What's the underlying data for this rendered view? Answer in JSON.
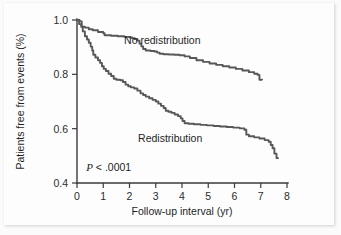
{
  "chart_data": {
    "type": "line",
    "title": "",
    "subtitle": "",
    "xlabel": "Follow-up interval (yr)",
    "ylabel": "Patients free from events (%)",
    "xlim": [
      0,
      8
    ],
    "ylim": [
      0.4,
      1.0
    ],
    "xticks": [
      "0",
      "1",
      "2",
      "3",
      "4",
      "5",
      "6",
      "7",
      "8"
    ],
    "xtick_values": [
      0,
      1,
      2,
      3,
      4,
      5,
      6,
      7,
      8
    ],
    "yticks": [
      "0.4",
      "0.6",
      "0.8",
      "1.0"
    ],
    "ytick_values": [
      0.4,
      0.6,
      0.8,
      1.0
    ],
    "grid": false,
    "legend_position": "inline-annotation",
    "line_color": "#585858",
    "axis_color": "#3a3a3a",
    "background_color": "#fdfdfd",
    "annotations": [
      {
        "name": "p-value",
        "text_italic": "P",
        "text": " < .0001",
        "x": 0.35,
        "y": 0.445
      }
    ],
    "series": [
      {
        "name": "No redistribution",
        "label_x": 3.25,
        "label_y": 0.925,
        "points": [
          [
            0.0,
            1.0
          ],
          [
            0.08,
            1.0
          ],
          [
            0.08,
            0.985
          ],
          [
            0.16,
            0.985
          ],
          [
            0.16,
            0.975
          ],
          [
            0.3,
            0.972
          ],
          [
            0.45,
            0.966
          ],
          [
            0.6,
            0.962
          ],
          [
            0.8,
            0.956
          ],
          [
            1.0,
            0.951
          ],
          [
            1.05,
            0.944
          ],
          [
            1.3,
            0.942
          ],
          [
            1.55,
            0.94
          ],
          [
            1.8,
            0.938
          ],
          [
            2.0,
            0.936
          ],
          [
            2.1,
            0.933
          ],
          [
            2.2,
            0.93
          ],
          [
            2.3,
            0.924
          ],
          [
            2.38,
            0.913
          ],
          [
            2.45,
            0.903
          ],
          [
            2.52,
            0.893
          ],
          [
            2.62,
            0.888
          ],
          [
            2.8,
            0.886
          ],
          [
            2.95,
            0.884
          ],
          [
            3.05,
            0.88
          ],
          [
            3.15,
            0.876
          ],
          [
            3.3,
            0.874
          ],
          [
            3.5,
            0.873
          ],
          [
            3.7,
            0.872
          ],
          [
            3.9,
            0.87
          ],
          [
            4.1,
            0.866
          ],
          [
            4.3,
            0.86
          ],
          [
            4.55,
            0.852
          ],
          [
            4.8,
            0.846
          ],
          [
            5.05,
            0.84
          ],
          [
            5.3,
            0.835
          ],
          [
            5.55,
            0.83
          ],
          [
            5.8,
            0.825
          ],
          [
            6.05,
            0.82
          ],
          [
            6.3,
            0.814
          ],
          [
            6.55,
            0.808
          ],
          [
            6.75,
            0.802
          ],
          [
            6.88,
            0.798
          ],
          [
            6.95,
            0.78
          ],
          [
            7.05,
            0.778
          ]
        ]
      },
      {
        "name": "Redistribution",
        "label_x": 3.55,
        "label_y": 0.565,
        "points": [
          [
            0.0,
            1.0
          ],
          [
            0.1,
            0.995
          ],
          [
            0.18,
            0.975
          ],
          [
            0.22,
            0.958
          ],
          [
            0.3,
            0.94
          ],
          [
            0.38,
            0.928
          ],
          [
            0.45,
            0.916
          ],
          [
            0.52,
            0.902
          ],
          [
            0.58,
            0.888
          ],
          [
            0.62,
            0.872
          ],
          [
            0.7,
            0.862
          ],
          [
            0.8,
            0.852
          ],
          [
            0.88,
            0.842
          ],
          [
            0.95,
            0.83
          ],
          [
            1.02,
            0.82
          ],
          [
            1.1,
            0.812
          ],
          [
            1.2,
            0.802
          ],
          [
            1.3,
            0.794
          ],
          [
            1.4,
            0.784
          ],
          [
            1.5,
            0.78
          ],
          [
            1.65,
            0.778
          ],
          [
            1.75,
            0.772
          ],
          [
            1.85,
            0.762
          ],
          [
            1.95,
            0.756
          ],
          [
            2.05,
            0.752
          ],
          [
            2.18,
            0.748
          ],
          [
            2.3,
            0.74
          ],
          [
            2.42,
            0.73
          ],
          [
            2.52,
            0.724
          ],
          [
            2.62,
            0.718
          ],
          [
            2.75,
            0.712
          ],
          [
            2.88,
            0.706
          ],
          [
            3.0,
            0.7
          ],
          [
            3.1,
            0.692
          ],
          [
            3.2,
            0.684
          ],
          [
            3.3,
            0.676
          ],
          [
            3.38,
            0.666
          ],
          [
            3.48,
            0.662
          ],
          [
            3.6,
            0.658
          ],
          [
            3.72,
            0.652
          ],
          [
            3.85,
            0.646
          ],
          [
            3.95,
            0.638
          ],
          [
            4.02,
            0.628
          ],
          [
            4.1,
            0.62
          ],
          [
            4.25,
            0.618
          ],
          [
            4.45,
            0.616
          ],
          [
            4.7,
            0.614
          ],
          [
            4.95,
            0.612
          ],
          [
            5.2,
            0.61
          ],
          [
            5.45,
            0.608
          ],
          [
            5.7,
            0.606
          ],
          [
            5.95,
            0.604
          ],
          [
            6.2,
            0.601
          ],
          [
            6.38,
            0.596
          ],
          [
            6.45,
            0.578
          ],
          [
            6.55,
            0.572
          ],
          [
            6.75,
            0.568
          ],
          [
            6.95,
            0.564
          ],
          [
            7.15,
            0.558
          ],
          [
            7.3,
            0.552
          ],
          [
            7.38,
            0.54
          ],
          [
            7.45,
            0.528
          ],
          [
            7.52,
            0.508
          ],
          [
            7.6,
            0.492
          ],
          [
            7.65,
            0.488
          ]
        ]
      }
    ]
  }
}
